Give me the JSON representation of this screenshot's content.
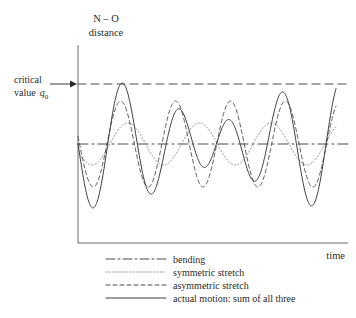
{
  "figure": {
    "background": "#ffffff",
    "stroke_color": "#555555"
  },
  "axes": {
    "y_label_line1": "N – O",
    "y_label_line2": "distance",
    "x_label": "time",
    "x_axis_color": "#6b6b6b",
    "y_axis_color": "#6b6b6b"
  },
  "annotations": {
    "critical_line1": "critical",
    "critical_line2": "value",
    "critical_symbol": "q",
    "critical_subscript": "0",
    "arrow_name": "critical-value-arrow"
  },
  "legend": {
    "items": [
      {
        "label": "bending",
        "style": "dashdot",
        "dasharray": "9,3,2,3"
      },
      {
        "label": "symmetric stretch",
        "style": "dotted",
        "dasharray": "1,2"
      },
      {
        "label": "asymmetric stretch",
        "style": "dashed",
        "dasharray": "4,3"
      },
      {
        "label": "actual motion: sum of all three",
        "style": "solid",
        "dasharray": "none"
      }
    ]
  },
  "chart_data": {
    "type": "line",
    "title": "",
    "xlabel": "time",
    "ylabel": "N – O distance",
    "grid": false,
    "legend_position": "bottom",
    "xlim": [
      0,
      1
    ],
    "ylim": [
      0,
      1
    ],
    "axis_pixels": {
      "x_left": 78,
      "x_right": 348,
      "y_top": 45,
      "y_bottom": 243,
      "curve_x_start": 78,
      "curve_x_end": 336
    },
    "reference_lines": [
      {
        "name": "critical-value-line",
        "label": "critical value q0",
        "y_pixel": 84,
        "style": "dashed",
        "dasharray": "8,5"
      },
      {
        "name": "equilibrium-baseline",
        "label": "bending",
        "y_pixel": 144,
        "style": "dashdot",
        "dasharray": "10,4,2,4"
      }
    ],
    "series": [
      {
        "name": "bending",
        "style": "dashdot",
        "dasharray": "10,4,2,4",
        "baseline_y_pixel": 144,
        "amplitude_pixels": 0,
        "cycles": 0,
        "phase_deg": 0,
        "description": "flat dash-dot line at equilibrium level"
      },
      {
        "name": "symmetric stretch",
        "style": "dotted",
        "dasharray": "1.2,2.2",
        "baseline_y_pixel": 144,
        "amplitude_pixels": 21,
        "cycles": 3.6,
        "phase_deg": 200,
        "description": "low frequency small amplitude dotted wave"
      },
      {
        "name": "asymmetric stretch",
        "style": "dashed",
        "dasharray": "4,3",
        "baseline_y_pixel": 144,
        "amplitude_pixels": 43,
        "cycles": 4.7,
        "phase_deg": 170,
        "description": "higher frequency larger amplitude dashed wave"
      },
      {
        "name": "actual motion: sum of all three",
        "style": "solid",
        "dasharray": "none",
        "baseline_y_pixel": 144,
        "amplitude_pixels": 60,
        "cycles": 4.7,
        "phase_deg": 170,
        "description": "solid curve equal to sum of the three modes; crosses critical value at far right"
      }
    ]
  }
}
